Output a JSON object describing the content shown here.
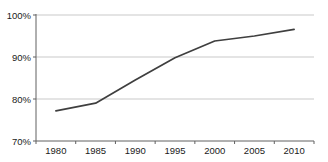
{
  "chart_data": {
    "type": "line",
    "title": "",
    "xlabel": "",
    "ylabel": "",
    "categories": [
      "1980",
      "1985",
      "1990",
      "1995",
      "2000",
      "2005",
      "2010"
    ],
    "series": [
      {
        "name": "percentage",
        "values": [
          77.2,
          79.0,
          84.5,
          89.8,
          93.8,
          95.0,
          96.6
        ]
      }
    ],
    "ylim": [
      70,
      100
    ],
    "y_ticks": [
      70,
      80,
      90,
      100
    ],
    "y_tick_labels": [
      "70%",
      "80%",
      "90%",
      "100%"
    ],
    "grid": "horizontal",
    "legend_position": "none",
    "colors": {
      "line": "#3f3f3f",
      "grid": "#c9c9c9",
      "axis": "#606060",
      "text": "#1a1a1a",
      "background": "#ffffff"
    }
  }
}
